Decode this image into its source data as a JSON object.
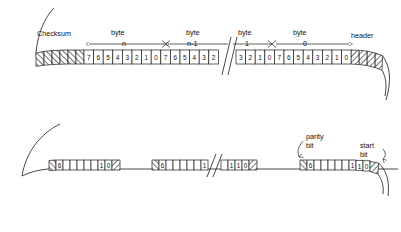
{
  "diagram": {
    "top_strip": {
      "labels": {
        "checksum": "Checksum",
        "header": "header",
        "byte_word": "byte",
        "byte_n": "n",
        "byte_n_minus_1": "n-1",
        "byte_1": "1",
        "byte_0": "0"
      },
      "checksum_cells": 6,
      "header_cells": 4,
      "bit_groups": [
        {
          "name": "byte-n",
          "bits": [
            "7",
            "6",
            "5",
            "4",
            "3",
            "2",
            "1",
            "0"
          ]
        },
        {
          "name": "byte-n-1-partial",
          "bits": [
            "7",
            "6",
            "5",
            "4",
            "3",
            "2"
          ]
        },
        {
          "name": "byte-1-partial",
          "bits": [
            "3",
            "2",
            "1",
            "0"
          ]
        },
        {
          "name": "byte-0",
          "bits": [
            "7",
            "6",
            "5",
            "4",
            "3",
            "2",
            "1",
            "0"
          ]
        }
      ]
    },
    "bottom_strip": {
      "labels": {
        "parity_bit_line1": "parity",
        "parity_bit_line2": "bit",
        "start_bit_line1": "start",
        "start_bit_line2": "bit"
      },
      "frames": [
        {
          "name": "frame-left",
          "cells": [
            "",
            "6",
            "",
            "",
            "",
            "",
            "",
            "1",
            "0",
            ""
          ]
        },
        {
          "name": "frame-middle",
          "cells": [
            "",
            "6",
            "",
            "",
            "",
            "",
            "1"
          ]
        },
        {
          "name": "frame-middle-tail",
          "cells": [
            "",
            "1",
            "1",
            "0",
            ""
          ]
        },
        {
          "name": "frame-right",
          "cells": [
            "",
            "6",
            "",
            "",
            "",
            "",
            "",
            "1",
            "1",
            "0",
            ""
          ]
        }
      ]
    },
    "colors": {
      "ink": "#1a1a1a",
      "paper": "#ffffff",
      "hatch": "#4a4a4a"
    }
  }
}
